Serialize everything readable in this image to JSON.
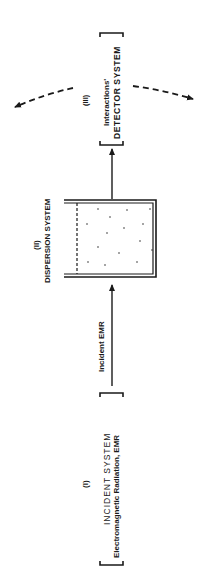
{
  "diagram": {
    "orientation": "rotated -90deg (reads bottom-to-top)",
    "incident_system": {
      "numeral": "(I)",
      "title": "INCIDENT SYSTEM",
      "subtitle": "Electromagnetic Radiation, EMR"
    },
    "incident_arrow": {
      "label": "Incident EMR"
    },
    "dispersion_system": {
      "numeral": "(II)",
      "title": "DISPERSION SYSTEM"
    },
    "detector_system": {
      "numeral": "(III)",
      "subtitle": "Interactions'",
      "title": "DETECTOR SYSTEM"
    },
    "colors": {
      "ink": "#1a1a1a",
      "background": "#ffffff"
    }
  }
}
